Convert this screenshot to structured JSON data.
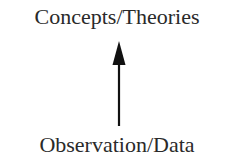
{
  "diagram": {
    "top_node": {
      "label": "Concepts/Theories"
    },
    "bottom_node": {
      "label": "Observation/Data"
    },
    "edge": {
      "from": "Observation/Data",
      "to": "Concepts/Theories",
      "direction": "up",
      "color": "#111111"
    }
  }
}
